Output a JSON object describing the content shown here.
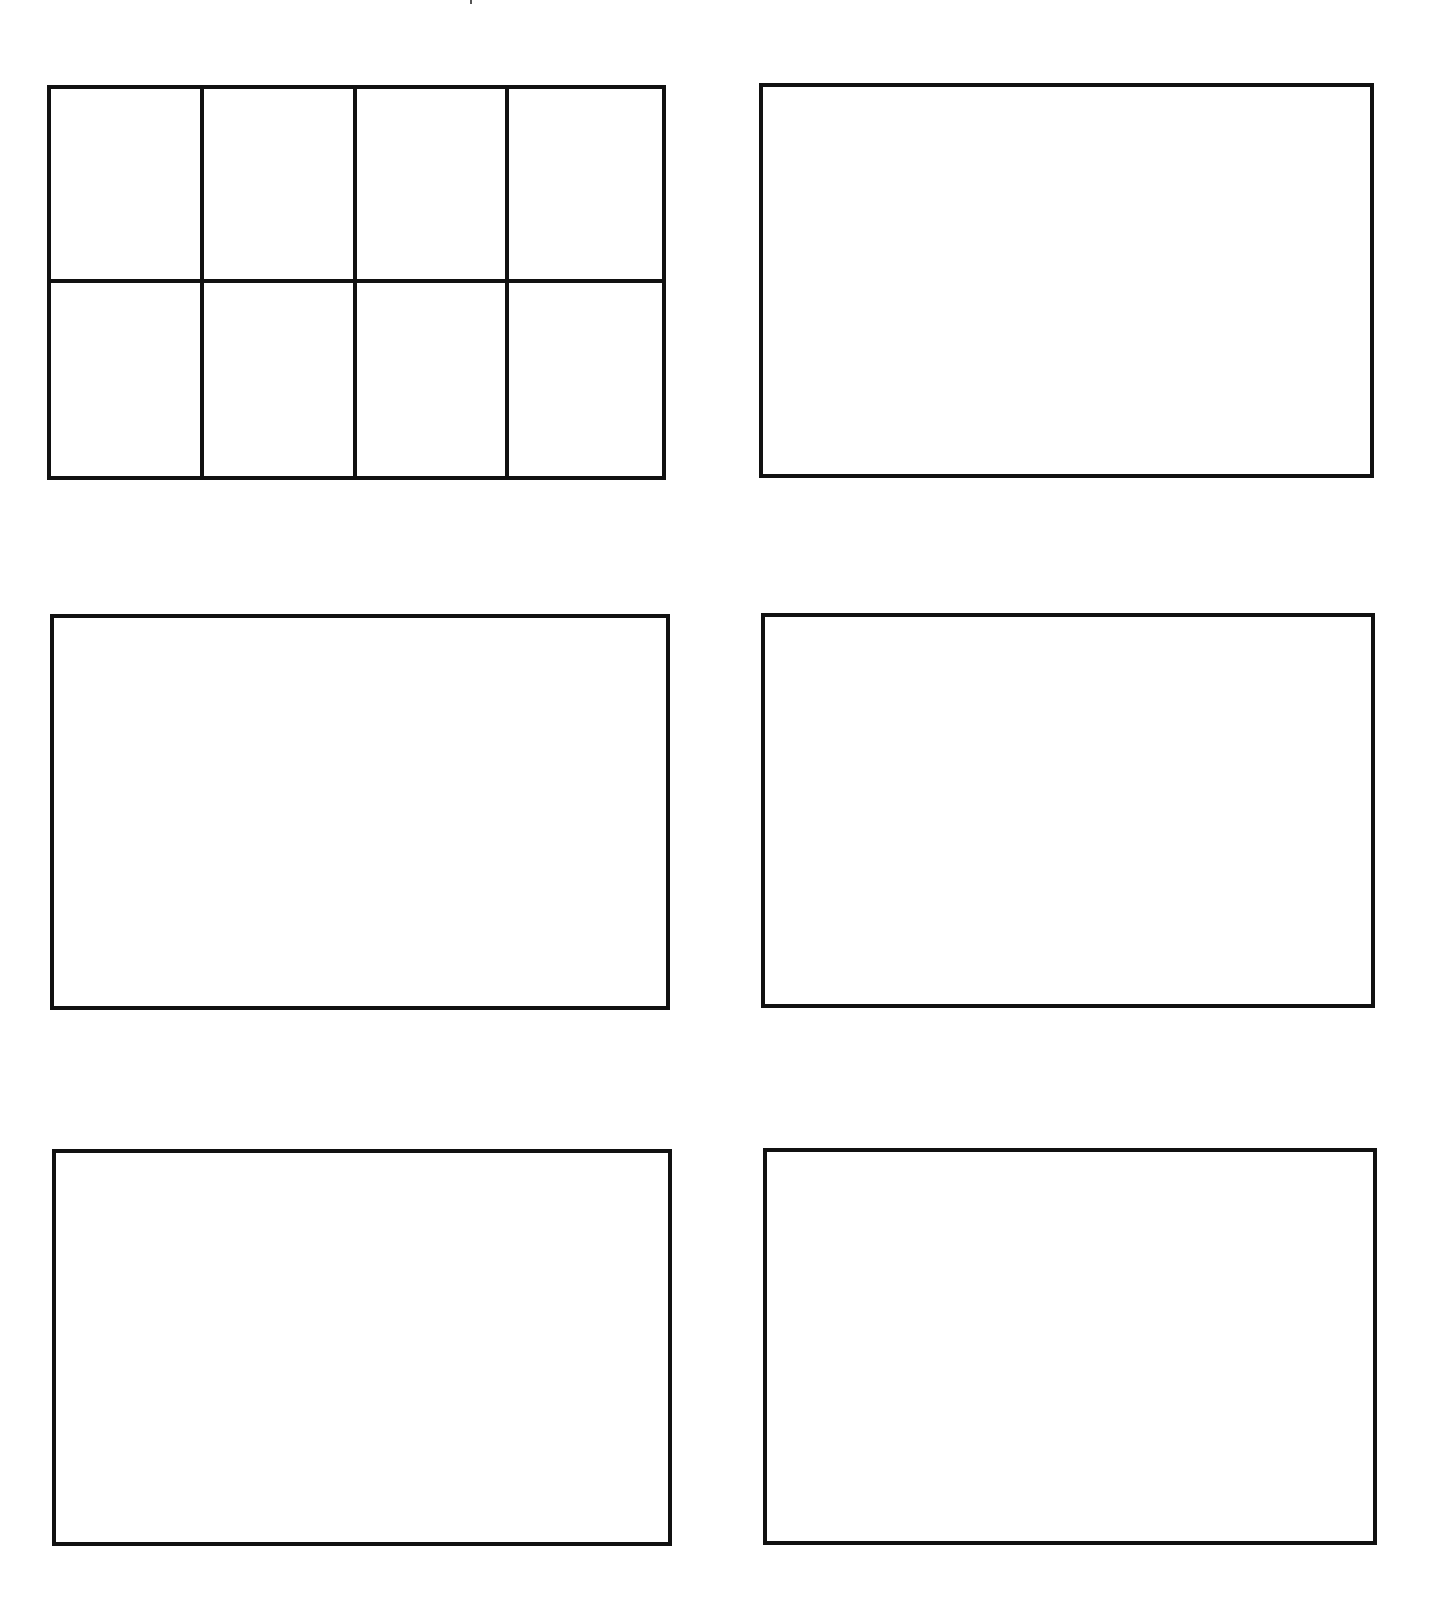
{
  "page": {
    "background": "#ffffff",
    "line_color": "#111111"
  },
  "boxes": [
    {
      "id": "box-1",
      "row": 1,
      "col": 1,
      "grid": {
        "columns": 4,
        "rows": 2
      }
    },
    {
      "id": "box-2",
      "row": 1,
      "col": 2,
      "grid": null
    },
    {
      "id": "box-3",
      "row": 2,
      "col": 1,
      "grid": null
    },
    {
      "id": "box-4",
      "row": 2,
      "col": 2,
      "grid": null
    },
    {
      "id": "box-5",
      "row": 3,
      "col": 1,
      "grid": null
    },
    {
      "id": "box-6",
      "row": 3,
      "col": 2,
      "grid": null
    }
  ]
}
